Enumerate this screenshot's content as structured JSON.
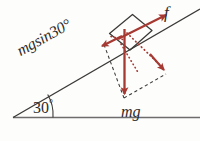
{
  "figure": {
    "labels": {
      "gravity_component_along_incline": "mgsin30°",
      "friction": "f",
      "weight": "mg",
      "incline_angle": "30",
      "degree_symbol": "°"
    },
    "colors": {
      "force_vector_red": "#a63a33",
      "outline_black": "#3b3936",
      "background": "#fdfdfc",
      "baseline_gray": "#6f6d6b"
    },
    "geometry": {
      "incline_angle_degrees": 30,
      "vertex_x": 13,
      "vertex_y": 117,
      "baseline_end_x": 200,
      "incline_end_x": 200,
      "incline_end_y": 9
    },
    "vectors": [
      {
        "name": "weight",
        "label": "mg",
        "direction": "straight down",
        "style": "solid",
        "color": "#a63a33"
      },
      {
        "name": "friction",
        "label": "f",
        "direction": "up the incline",
        "style": "solid",
        "color": "#a63a33"
      },
      {
        "name": "gravity-parallel-component",
        "label": "mgsin30°",
        "direction": "down the incline",
        "style": "solid",
        "color": "#a63a33"
      },
      {
        "name": "gravity-perpendicular-component",
        "label": "",
        "direction": "into the incline surface",
        "style": "dotted",
        "color": "#a63a33"
      }
    ]
  }
}
